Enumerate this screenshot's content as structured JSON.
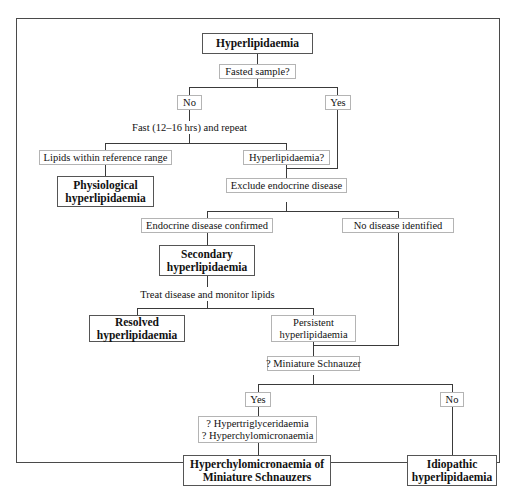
{
  "diagram": {
    "type": "flowchart",
    "frame_color": "#4a4a4a",
    "step_border_color": "#b4b4b4",
    "terminal_border_color": "#555555",
    "text_color": "#111111"
  },
  "nodes": {
    "root": "Hyperlipidaemia",
    "fasted_sample": "Fasted sample?",
    "branch_no": "No",
    "branch_yes": "Yes",
    "fast_repeat": "Fast (12–16 hrs) and repeat",
    "lipids_within_range": "Lipids within reference range",
    "hyperlipidaemia_q": "Hyperlipidaemia?",
    "physiological": "Physiological\nhyperlipidaemia",
    "exclude_endocrine": "Exclude endocrine disease",
    "endocrine_confirmed": "Endocrine disease confirmed",
    "no_disease_identified": "No disease identified",
    "secondary": "Secondary\nhyperlipidaemia",
    "treat_monitor": "Treat disease and monitor lipids",
    "resolved": "Resolved\nhyperlipidaemia",
    "persistent": "Persistent\nhyperlipidaemia",
    "miniature_schnauzer": "? Miniature Schnauzer",
    "schnauzer_yes": "Yes",
    "schnauzer_no": "No",
    "hyper_questions": "? Hypertriglyceridaemia\n? Hyperchylomicronaemia",
    "hyperchylo_schnauzers": "Hyperchylomicronaemia of\nMiniature Schnauzers",
    "idiopathic": "Idiopathic\nhyperlipidaemia"
  }
}
